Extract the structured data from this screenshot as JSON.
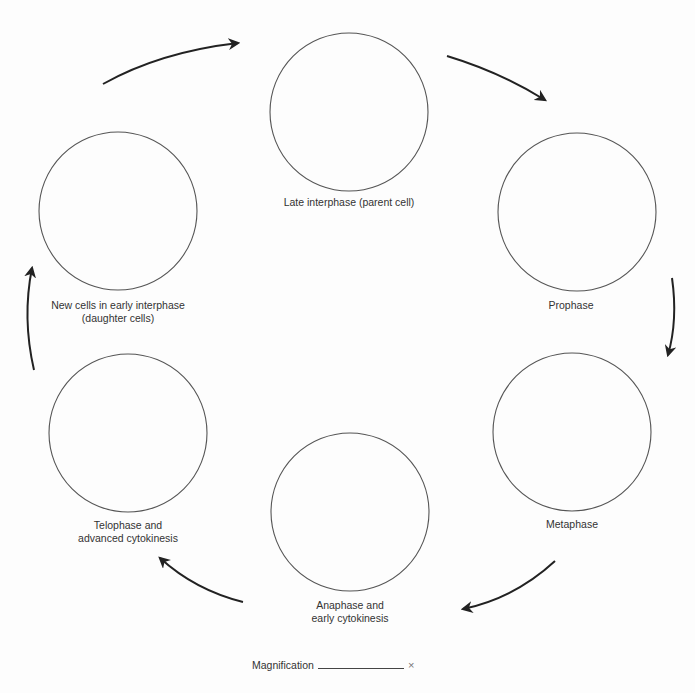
{
  "diagram": {
    "type": "cycle",
    "stages": [
      {
        "id": "late-interphase",
        "lines": [
          "Late interphase (parent cell)"
        ],
        "cx": 349,
        "cy": 112,
        "r": 79,
        "label_x": 349,
        "label_y": 202
      },
      {
        "id": "prophase",
        "lines": [
          "Prophase"
        ],
        "cx": 577,
        "cy": 212,
        "r": 79,
        "label_x": 571,
        "label_y": 305
      },
      {
        "id": "metaphase",
        "lines": [
          "Metaphase"
        ],
        "cx": 572,
        "cy": 432,
        "r": 79,
        "label_x": 572,
        "label_y": 524
      },
      {
        "id": "anaphase",
        "lines": [
          "Anaphase and",
          "early cytokinesis"
        ],
        "cx": 350,
        "cy": 512,
        "r": 79,
        "label_x": 350,
        "label_y": 605
      },
      {
        "id": "telophase",
        "lines": [
          "Telophase and",
          "advanced cytokinesis"
        ],
        "cx": 128,
        "cy": 433,
        "r": 79,
        "label_x": 128,
        "label_y": 525
      },
      {
        "id": "early-interphase",
        "lines": [
          "New cells in early interphase",
          "(daughter cells)"
        ],
        "cx": 118,
        "cy": 211,
        "r": 79,
        "label_x": 118,
        "label_y": 305
      }
    ],
    "arrows": [
      {
        "id": "late-interphase-to-prophase",
        "d": "M 447 56 Q 500 72 545 100"
      },
      {
        "id": "prophase-to-metaphase",
        "d": "M 672 278 Q 678 320 668 355"
      },
      {
        "id": "metaphase-to-anaphase",
        "d": "M 555 561 Q 515 598 463 609"
      },
      {
        "id": "anaphase-to-telophase",
        "d": "M 243 602 Q 195 590 160 558"
      },
      {
        "id": "telophase-to-early-interphase",
        "d": "M 34 370 Q 22 318 32 268"
      },
      {
        "id": "early-interphase-to-late-interphase",
        "d": "M 103 84 Q 160 52 238 43"
      }
    ],
    "colors": {
      "circle_stroke": "#555555",
      "arrow": "#222222",
      "text": "#333333"
    }
  },
  "footer": {
    "magnification_label": "Magnification",
    "magnification_value": "",
    "times_symbol": "×"
  }
}
